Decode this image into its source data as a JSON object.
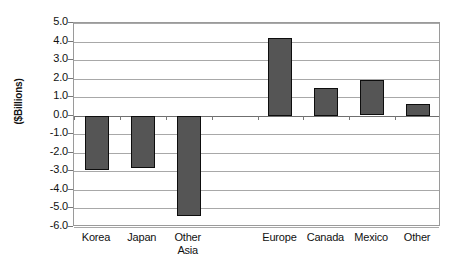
{
  "chart_data": {
    "type": "bar",
    "title": "",
    "xlabel": "",
    "ylabel": "($Billions)",
    "categories": [
      "Korea",
      "Japan",
      "Other Asia",
      "",
      "Europe",
      "Canada",
      "Mexico",
      "Other"
    ],
    "values": [
      -2.9,
      -2.8,
      -5.4,
      null,
      4.2,
      1.5,
      1.9,
      0.65
    ],
    "ylim": [
      -6.0,
      5.0
    ],
    "ytick_labels": [
      "5.0",
      "4.0",
      "3.0",
      "2.0",
      "1.0",
      "0.0",
      "-1.0",
      "-2.0",
      "-3.0",
      "-4.0",
      "-5.0",
      "-6.0"
    ],
    "ytick_values": [
      5.0,
      4.0,
      3.0,
      2.0,
      1.0,
      0.0,
      -1.0,
      -2.0,
      -3.0,
      -4.0,
      -5.0,
      -6.0
    ],
    "grid": true,
    "legend": null,
    "bar_color": "#555555",
    "bar_border_color": "#0d0d0d",
    "grid_color": "#a8a8a8",
    "axis_color": "#9a9a9a",
    "series": [
      {
        "name": "",
        "points": [
          {
            "category": "Korea",
            "value": -2.9
          },
          {
            "category": "Japan",
            "value": -2.8
          },
          {
            "category": "Other Asia",
            "value": -5.4
          },
          {
            "category": "",
            "value": null
          },
          {
            "category": "Europe",
            "value": 4.2
          },
          {
            "category": "Canada",
            "value": 1.5
          },
          {
            "category": "Mexico",
            "value": 1.9
          },
          {
            "category": "Other",
            "value": 0.65
          }
        ]
      }
    ]
  }
}
